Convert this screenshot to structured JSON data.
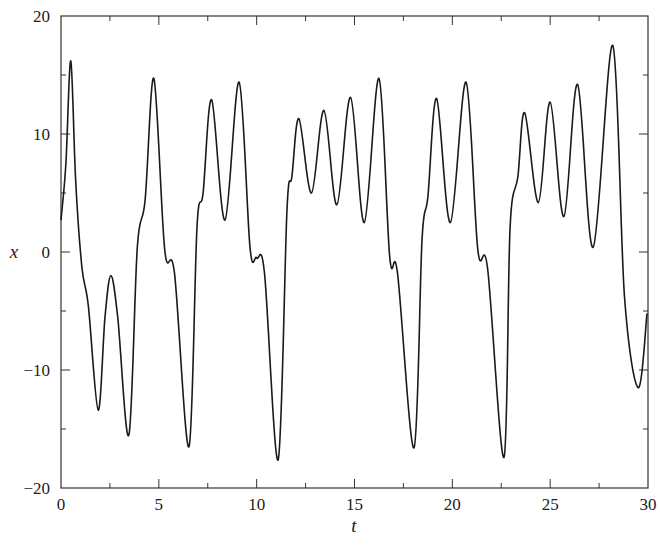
{
  "chart_data": {
    "type": "line",
    "title": "",
    "xlabel": "t",
    "ylabel": "x",
    "xlim": [
      0,
      30
    ],
    "ylim": [
      -20,
      20
    ],
    "grid": false,
    "legend": null,
    "x_ticks": [
      0,
      5,
      10,
      15,
      20,
      25,
      30
    ],
    "x_tick_labels": [
      "0",
      "5",
      "10",
      "15",
      "20",
      "25",
      "30"
    ],
    "x_minor_ticks": [
      2.5,
      7.5,
      12.5,
      17.5,
      22.5,
      27.5
    ],
    "y_ticks": [
      -20,
      -10,
      0,
      10,
      20
    ],
    "y_tick_labels": [
      "−20",
      "−10",
      "0",
      "10",
      "20"
    ],
    "y_minor_ticks": [
      -15,
      -5,
      5,
      15
    ],
    "line_color": "#1a1a1a",
    "series": [
      {
        "name": "x(t)",
        "x": [
          0,
          0.25,
          0.5,
          0.75,
          1.07,
          1.4,
          1.9,
          2.25,
          2.55,
          2.9,
          3.47,
          3.9,
          4.3,
          4.75,
          5.3,
          5.8,
          6.54,
          6.95,
          7.26,
          7.7,
          8.38,
          9.1,
          9.66,
          10.0,
          10.4,
          11.1,
          11.55,
          11.8,
          12.16,
          12.8,
          13.44,
          14.1,
          14.8,
          15.5,
          16.25,
          16.8,
          17.2,
          18.04,
          18.45,
          18.75,
          19.2,
          19.9,
          20.7,
          21.3,
          21.8,
          22.64,
          22.95,
          23.35,
          23.7,
          24.4,
          25.0,
          25.7,
          26.4,
          27.2,
          28.2,
          28.8,
          29.5,
          29.95
        ],
        "values": [
          2.7,
          7.5,
          16.2,
          6.0,
          -1.3,
          -4.6,
          -13.4,
          -5.5,
          -2.0,
          -5.5,
          -15.5,
          0.4,
          4.4,
          14.7,
          0.2,
          -1.8,
          -16.5,
          2.1,
          5.0,
          12.9,
          2.7,
          14.4,
          0.4,
          -0.5,
          -1.8,
          -17.6,
          3.6,
          6.4,
          11.3,
          5.0,
          12.0,
          4.0,
          13.1,
          2.5,
          14.7,
          -0.4,
          -1.8,
          -16.6,
          1.0,
          4.7,
          13.0,
          2.5,
          14.4,
          0.2,
          -1.4,
          -17.4,
          2.1,
          6.4,
          11.8,
          4.2,
          12.7,
          3.0,
          14.2,
          0.4,
          17.5,
          -3.8,
          -11.5,
          -5.2
        ]
      }
    ]
  }
}
